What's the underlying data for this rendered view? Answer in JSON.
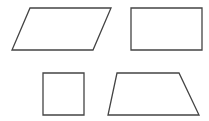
{
  "diagram": {
    "background": "#ffffff",
    "stroke_color": "#444444",
    "stroke_width": 1.3,
    "shapes": [
      {
        "name": "parallelogram",
        "points": "30,8 111,8 93,50 12,50"
      },
      {
        "name": "rectangle",
        "points": "131,8 202,8 202,50 131,50"
      },
      {
        "name": "square",
        "points": "43,73 84,73 84,115 43,115"
      },
      {
        "name": "trapezoid",
        "points": "117,73 179,73 199,115 108,115"
      }
    ]
  }
}
